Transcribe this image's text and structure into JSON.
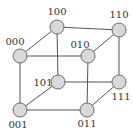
{
  "diagram": {
    "title": "",
    "type": "3-cube (hypercube) graph",
    "colors": {
      "node_fill": "#d9d9d9",
      "node_stroke": "#6a6a6a",
      "edge": "#555555",
      "label": "#333333"
    },
    "nodes": [
      {
        "id": "100",
        "label": "100",
        "cx": 57,
        "cy": 27,
        "lx": 57,
        "ly": 15,
        "anchor": "middle"
      },
      {
        "id": "110",
        "label": "110",
        "cx": 119,
        "cy": 30,
        "lx": 119,
        "ly": 18,
        "anchor": "middle"
      },
      {
        "id": "000",
        "label": "000",
        "cx": 20,
        "cy": 56,
        "lx": 15,
        "ly": 45,
        "anchor": "middle"
      },
      {
        "id": "010",
        "label": "010",
        "cx": 88,
        "cy": 56,
        "lx": 80,
        "ly": 48,
        "anchor": "middle"
      },
      {
        "id": "101",
        "label": "101",
        "cx": 58,
        "cy": 82,
        "lx": 43,
        "ly": 86,
        "anchor": "middle"
      },
      {
        "id": "111",
        "label": "111",
        "cx": 119,
        "cy": 82,
        "lx": 121,
        "ly": 100,
        "anchor": "middle"
      },
      {
        "id": "001",
        "label": "001",
        "cx": 20,
        "cy": 110,
        "lx": 18,
        "ly": 128,
        "anchor": "middle"
      },
      {
        "id": "011",
        "label": "011",
        "cx": 87,
        "cy": 110,
        "lx": 87,
        "ly": 127,
        "anchor": "middle"
      }
    ],
    "edges": [
      [
        "000",
        "100"
      ],
      [
        "100",
        "110"
      ],
      [
        "000",
        "010"
      ],
      [
        "010",
        "110"
      ],
      [
        "001",
        "101"
      ],
      [
        "101",
        "111"
      ],
      [
        "001",
        "011"
      ],
      [
        "011",
        "111"
      ],
      [
        "000",
        "001"
      ],
      [
        "100",
        "101"
      ],
      [
        "010",
        "011"
      ],
      [
        "110",
        "111"
      ]
    ]
  }
}
